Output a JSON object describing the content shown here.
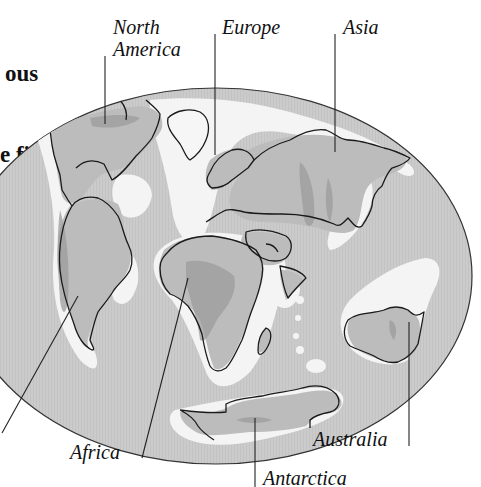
{
  "intro_paragraph": {
    "lines": [
      "ous",
      "e first",
      "rized",
      "d"
    ]
  },
  "map": {
    "type": "Pangaea-style continental reconstruction on elliptical projection",
    "colors": {
      "ocean": "#c9c9c9",
      "shelf": "#f2f2f2",
      "land": "#bdbdbd",
      "highland": "#9a9a9a",
      "outline": "#1a1a1a",
      "background": "#ffffff"
    }
  },
  "labels": {
    "north_america_line1": "North",
    "north_america_line2": "America",
    "europe": "Europe",
    "asia": "Asia",
    "africa": "Africa",
    "australia": "Australia",
    "antarctica": "Antarctica"
  }
}
